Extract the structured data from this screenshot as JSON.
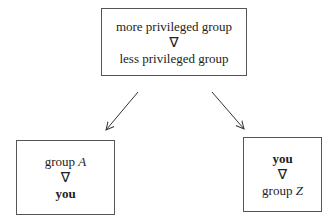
{
  "diagram": {
    "top_box": {
      "line1": "more privileged group",
      "symbol": "∇",
      "line2": "less privileged group"
    },
    "left_box": {
      "line1_text": "group ",
      "line1_var": "A",
      "symbol": "∇",
      "line2": "you"
    },
    "right_box": {
      "line1": "you",
      "symbol": "∇",
      "line2_text": "group ",
      "line2_var": "Z"
    },
    "edges": [
      {
        "from": "top_box",
        "to": "left_box"
      },
      {
        "from": "top_box",
        "to": "right_box"
      }
    ]
  }
}
